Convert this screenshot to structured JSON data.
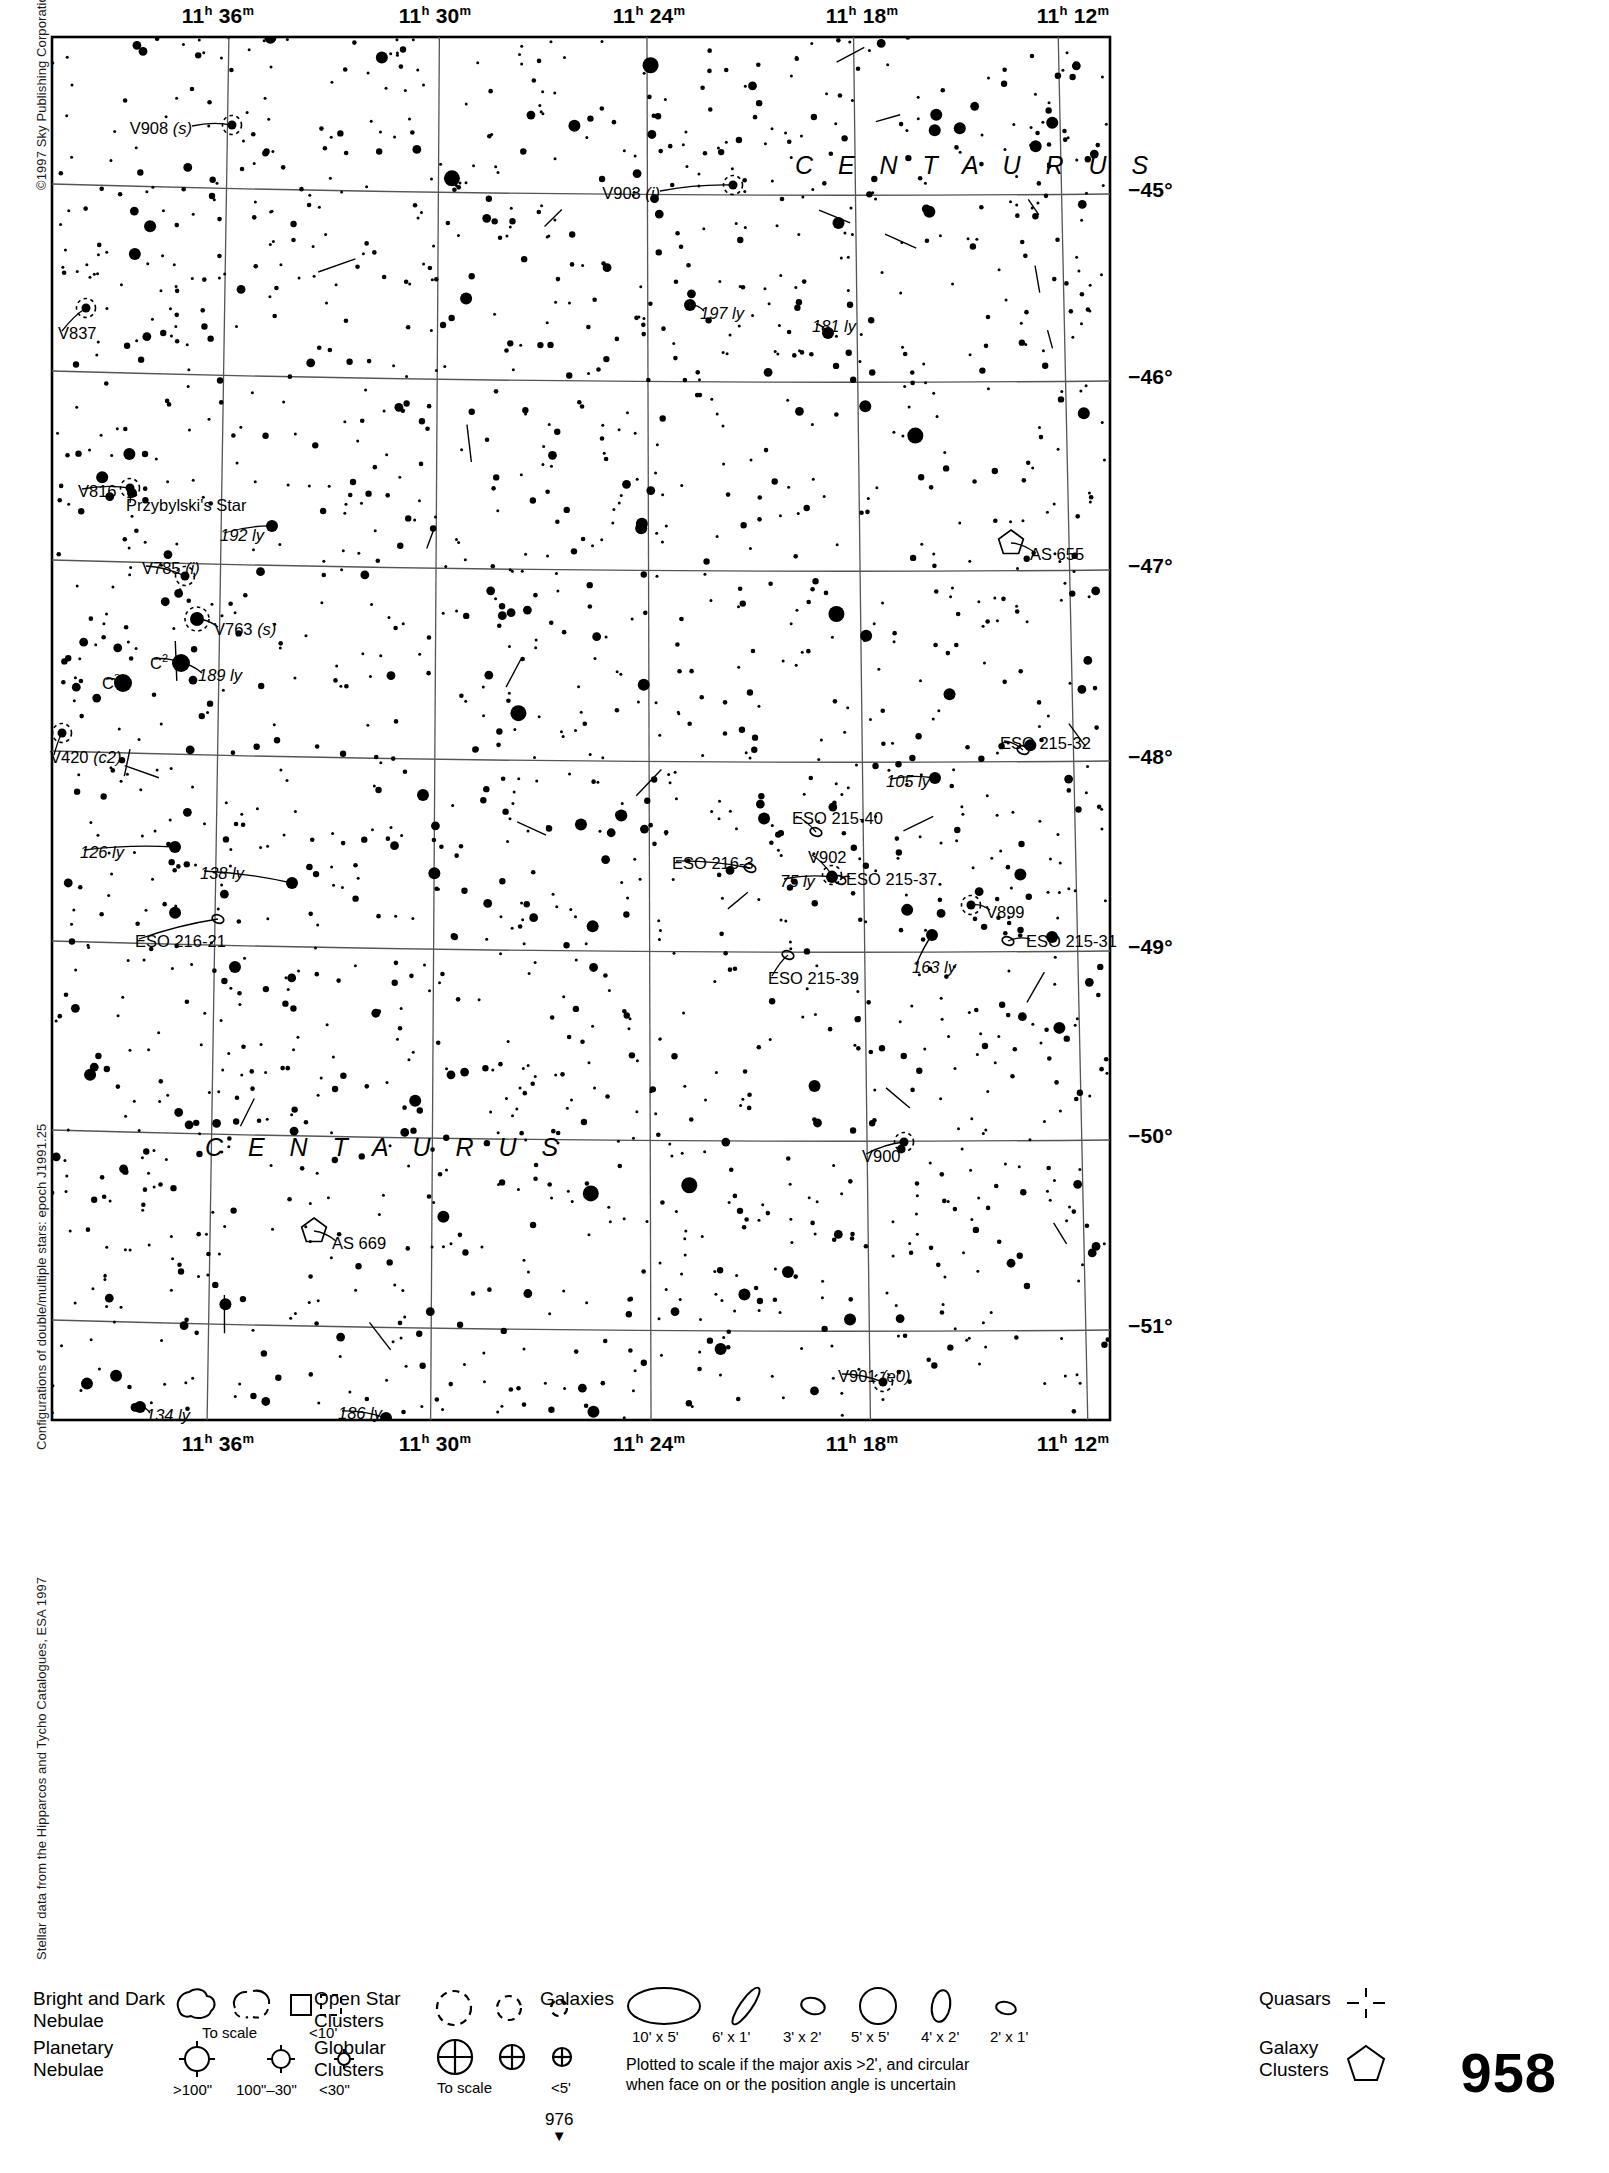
{
  "page": {
    "number": "958",
    "footer_marker": "976",
    "copyright": "©1997 Sky Publishing Corporation",
    "side_note_double_stars": "Configurations of double/multiple stars: epoch J1991.25",
    "side_note_source": "Stellar data from the Hipparcos and Tycho Catalogues, ESA 1997"
  },
  "axes": {
    "ra_top": [
      {
        "h": "11",
        "m": "36",
        "x": 168
      },
      {
        "h": "11",
        "m": "30",
        "x": 385
      },
      {
        "h": "11",
        "m": "24",
        "x": 599
      },
      {
        "h": "11",
        "m": "18",
        "x": 812
      },
      {
        "h": "11",
        "m": "12",
        "x": 1023
      }
    ],
    "ra_bottom": [
      {
        "h": "11",
        "m": "36",
        "x": 168
      },
      {
        "h": "11",
        "m": "30",
        "x": 385
      },
      {
        "h": "11",
        "m": "24",
        "x": 599
      },
      {
        "h": "11",
        "m": "18",
        "x": 812
      },
      {
        "h": "11",
        "m": "12",
        "x": 1023
      }
    ],
    "dec_right": [
      {
        "label": "−45°",
        "y": 155
      },
      {
        "label": "−46°",
        "y": 342
      },
      {
        "label": "−47°",
        "y": 531
      },
      {
        "label": "−48°",
        "y": 722
      },
      {
        "label": "−49°",
        "y": 912
      },
      {
        "label": "−50°",
        "y": 1101
      },
      {
        "label": "−51°",
        "y": 1291
      }
    ]
  },
  "chart_data": {
    "type": "scatter",
    "xlabel": "Right Ascension",
    "ylabel": "Declination",
    "xlim": [
      "11h 38m",
      "11h 10m"
    ],
    "ylim": [
      -44.6,
      -51.4
    ],
    "grid": true,
    "constellation_labels": [
      {
        "text": "C E N T A U R U S",
        "x": 745,
        "y": 118
      },
      {
        "text": "C E N T A U R U S",
        "x": 155,
        "y": 1100
      }
    ],
    "labeled_objects": [
      {
        "name": "V908 (s)",
        "kind": "variable-star",
        "x": 182,
        "y": 90,
        "label_x": 142,
        "label_y": 85,
        "anchor": "end"
      },
      {
        "name": "V903 (i)",
        "kind": "variable-star",
        "x": 683,
        "y": 150,
        "label_x": 610,
        "label_y": 150,
        "anchor": "end"
      },
      {
        "name": "V837",
        "kind": "variable-star",
        "x": 36,
        "y": 273,
        "label_x": 8,
        "label_y": 290,
        "anchor": "start"
      },
      {
        "name": "197 ly",
        "kind": "distance",
        "x": 640,
        "y": 270,
        "label_x": 650,
        "label_y": 270,
        "anchor": "start"
      },
      {
        "name": "181 ly",
        "kind": "distance",
        "x": 778,
        "y": 298,
        "label_x": 762,
        "label_y": 283,
        "anchor": "start"
      },
      {
        "name": "V816",
        "kind": "variable-star",
        "x": 80,
        "y": 453,
        "label_x": 28,
        "label_y": 448,
        "anchor": "start"
      },
      {
        "name": "Przybylski's Star",
        "kind": "star",
        "x": 82,
        "y": 458,
        "label_x": 76,
        "label_y": 462,
        "anchor": "start"
      },
      {
        "name": "192 ly",
        "kind": "distance",
        "x": 222,
        "y": 491,
        "label_x": 170,
        "label_y": 492,
        "anchor": "start"
      },
      {
        "name": "AS 655",
        "kind": "galaxy-cluster",
        "x": 961,
        "y": 508,
        "label_x": 980,
        "label_y": 511,
        "anchor": "start"
      },
      {
        "name": "V785 (i)",
        "kind": "variable-star",
        "x": 135,
        "y": 541,
        "label_x": 92,
        "label_y": 525,
        "anchor": "start"
      },
      {
        "name": "V763 (s)",
        "kind": "variable-star",
        "x": 147,
        "y": 584,
        "label_x": 164,
        "label_y": 586,
        "anchor": "start"
      },
      {
        "name": "C2",
        "kind": "star",
        "x": 131,
        "y": 628,
        "label_x": 100,
        "label_y": 618,
        "anchor": "start"
      },
      {
        "name": "189 ly",
        "kind": "distance",
        "x": 131,
        "y": 628,
        "label_x": 148,
        "label_y": 632,
        "anchor": "start"
      },
      {
        "name": "C3",
        "kind": "star",
        "x": 73,
        "y": 648,
        "label_x": 52,
        "label_y": 638,
        "anchor": "start"
      },
      {
        "name": "V420 (c2)",
        "kind": "variable-star",
        "x": 12,
        "y": 698,
        "label_x": 0,
        "label_y": 714,
        "anchor": "start"
      },
      {
        "name": "ESO 215-32",
        "kind": "galaxy",
        "x": 973,
        "y": 715,
        "label_x": 950,
        "label_y": 700,
        "anchor": "start"
      },
      {
        "name": "105 ly",
        "kind": "distance",
        "x": 885,
        "y": 743,
        "label_x": 836,
        "label_y": 738,
        "anchor": "start"
      },
      {
        "name": "ESO 215-40",
        "kind": "galaxy",
        "x": 766,
        "y": 797,
        "label_x": 742,
        "label_y": 775,
        "anchor": "start"
      },
      {
        "name": "ESO 216-3",
        "kind": "galaxy",
        "x": 700,
        "y": 833,
        "label_x": 622,
        "label_y": 820,
        "anchor": "start"
      },
      {
        "name": "126 ly",
        "kind": "distance",
        "x": 125,
        "y": 812,
        "label_x": 30,
        "label_y": 809,
        "anchor": "start"
      },
      {
        "name": "138 ly",
        "kind": "distance",
        "x": 242,
        "y": 848,
        "label_x": 150,
        "label_y": 830,
        "anchor": "start"
      },
      {
        "name": "V902",
        "kind": "variable-star",
        "x": 782,
        "y": 840,
        "label_x": 758,
        "label_y": 814,
        "anchor": "start"
      },
      {
        "name": "75 ly",
        "kind": "distance",
        "x": 782,
        "y": 842,
        "label_x": 730,
        "label_y": 838,
        "anchor": "start"
      },
      {
        "name": "ESO 215-37",
        "kind": "galaxy",
        "x": 790,
        "y": 845,
        "label_x": 796,
        "label_y": 836,
        "anchor": "start"
      },
      {
        "name": "V899",
        "kind": "variable-star",
        "x": 921,
        "y": 870,
        "label_x": 936,
        "label_y": 869,
        "anchor": "start"
      },
      {
        "name": "ESO 216-21",
        "kind": "galaxy",
        "x": 168,
        "y": 884,
        "label_x": 85,
        "label_y": 898,
        "anchor": "start"
      },
      {
        "name": "ESO 215-31",
        "kind": "galaxy",
        "x": 958,
        "y": 906,
        "label_x": 976,
        "label_y": 898,
        "anchor": "start"
      },
      {
        "name": "163 ly",
        "kind": "distance",
        "x": 882,
        "y": 900,
        "label_x": 862,
        "label_y": 924,
        "anchor": "start"
      },
      {
        "name": "ESO 215-39",
        "kind": "galaxy",
        "x": 738,
        "y": 920,
        "label_x": 718,
        "label_y": 935,
        "anchor": "start"
      },
      {
        "name": "V900",
        "kind": "variable-star",
        "x": 854,
        "y": 1107,
        "label_x": 812,
        "label_y": 1113,
        "anchor": "start"
      },
      {
        "name": "AS 669",
        "kind": "galaxy-cluster",
        "x": 264,
        "y": 1196,
        "label_x": 282,
        "label_y": 1200,
        "anchor": "start"
      },
      {
        "name": "V901 (e0)",
        "kind": "variable-star",
        "x": 833,
        "y": 1347,
        "label_x": 788,
        "label_y": 1333,
        "anchor": "start"
      },
      {
        "name": "134 ly",
        "kind": "distance",
        "x": 90,
        "y": 1372,
        "label_x": 96,
        "label_y": 1372,
        "anchor": "start"
      },
      {
        "name": "186 ly",
        "kind": "distance",
        "x": 336,
        "y": 1383,
        "label_x": 288,
        "label_y": 1370,
        "anchor": "start"
      }
    ]
  },
  "legend": {
    "nebulae": {
      "title_line1": "Bright and Dark",
      "title_line2": "Nebulae",
      "to_scale": "To scale",
      "small": "<10'"
    },
    "planetary": {
      "title_line1": "Planetary",
      "title_line2": "Nebulae",
      "sizes": [
        ">100\"",
        "100\"–30\"",
        "<30\""
      ]
    },
    "open_clusters": {
      "title_line1": "Open Star",
      "title_line2": "Clusters"
    },
    "globular_clusters": {
      "title_line1": "Globular",
      "title_line2": "Clusters",
      "to_scale": "To scale",
      "small": "<5'"
    },
    "galaxies": {
      "title": "Galaxies",
      "sizes": [
        "10' x 5'",
        "6' x 1'",
        "3' x 2'",
        "5' x 5'",
        "4' x 2'",
        "2' x 1'"
      ],
      "note_line1": "Plotted to scale if the major axis >2', and circular",
      "note_line2": "when face on or the position angle is uncertain"
    },
    "quasars": {
      "title": "Quasars"
    },
    "galaxy_clusters": {
      "title_line1": "Galaxy",
      "title_line2": "Clusters"
    }
  }
}
